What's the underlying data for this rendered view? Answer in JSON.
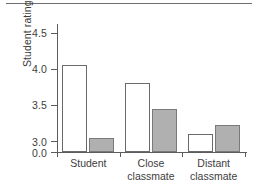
{
  "figure": {
    "has_top_rule": true,
    "background_color": "#ffffff"
  },
  "chart_data": {
    "type": "bar",
    "title": "",
    "xlabel": "",
    "ylabel": "Student ratings",
    "categories": [
      "Student",
      "Close\nclassmate",
      "Distant\nclassmate"
    ],
    "category_labels_flat": [
      "Student",
      "Close classmate",
      "Distant classmate"
    ],
    "series": [
      {
        "name": "open",
        "fill": "#ffffff",
        "values": [
          4.05,
          3.8,
          3.1
        ]
      },
      {
        "name": "filled",
        "fill": "#b0b0b0",
        "values": [
          3.05,
          3.45,
          3.23
        ]
      }
    ],
    "ylim": [
      2.85,
      4.62
    ],
    "yticks": [
      0.0,
      3.0,
      3.5,
      4.0,
      4.5
    ],
    "ytick_labels": [
      "0.0",
      "3.0",
      "3.5",
      "4.0",
      "4.5"
    ],
    "axis_broken": true,
    "baseline_value": 2.85,
    "grid": false,
    "legend": "none",
    "legend_position": "none"
  },
  "colors": {
    "axis": "#5c5c5c",
    "bar_outline": "#6a6a6a",
    "bar_fill_gray": "#b0b0b0",
    "bar_fill_white": "#ffffff",
    "text": "#3d3d3d",
    "rule": "#6e6e6e"
  }
}
